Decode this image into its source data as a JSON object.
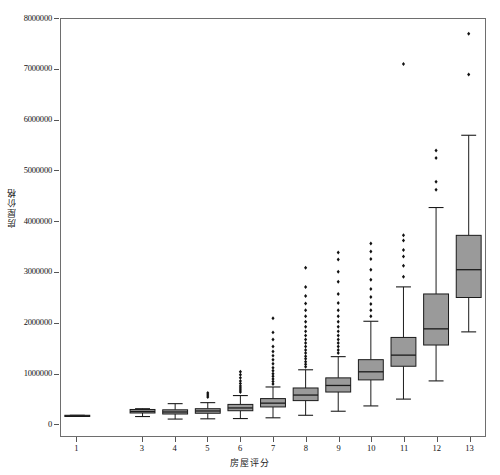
{
  "figure": {
    "background_color": "#ffffff",
    "frame_color": "#6e6e6e",
    "has_title": false,
    "title": ""
  },
  "axes": {
    "y_title": "房屋价格",
    "x_title": "房屋评分",
    "grid": false
  },
  "chart_data": {
    "type": "box",
    "title": "",
    "xlabel": "房屋评分",
    "ylabel": "房屋价格",
    "xlim": [
      0.5,
      13.5
    ],
    "ylim": [
      -250000,
      8000000
    ],
    "grid": false,
    "legend": null,
    "box_fill_color": "#9a9a9a",
    "box_edge_color": "#1a1a1a",
    "whisker_color": "#1a1a1a",
    "flier_color": "#111111",
    "y_ticks": [
      0,
      1000000,
      2000000,
      3000000,
      4000000,
      5000000,
      6000000,
      7000000,
      8000000
    ],
    "y_tick_labels": [
      "0",
      "1000000",
      "2000000",
      "3000000",
      "4000000",
      "5000000",
      "6000000",
      "7000000",
      "8000000"
    ],
    "x_ticks": [
      1,
      3,
      4,
      5,
      6,
      7,
      8,
      9,
      10,
      11,
      12,
      13
    ],
    "x_tick_labels": [
      "1",
      "3",
      "4",
      "5",
      "6",
      "7",
      "8",
      "9",
      "10",
      "11",
      "12",
      "13"
    ],
    "categories": [
      "1",
      "3",
      "4",
      "5",
      "6",
      "7",
      "8",
      "9",
      "10",
      "11",
      "12",
      "13"
    ],
    "boxes": [
      {
        "category": "1",
        "x": 1,
        "whisker_low": 142000,
        "q1": 142000,
        "median": 142000,
        "q3": 160000,
        "whisker_high": 160000,
        "fliers": []
      },
      {
        "category": "3",
        "x": 3,
        "whisker_low": 135000,
        "q1": 205000,
        "median": 235000,
        "q3": 275000,
        "whisker_high": 290000,
        "fliers": []
      },
      {
        "category": "4",
        "x": 4,
        "whisker_low": 85000,
        "q1": 185000,
        "median": 225000,
        "q3": 268000,
        "whisker_high": 390000,
        "fliers": []
      },
      {
        "category": "5",
        "x": 5,
        "whisker_low": 90000,
        "q1": 200000,
        "median": 245000,
        "q3": 290000,
        "whisker_high": 410000,
        "fliers": [
          520000,
          560000,
          600000
        ]
      },
      {
        "category": "6",
        "x": 6,
        "whisker_low": 95000,
        "q1": 250000,
        "median": 305000,
        "q3": 375000,
        "whisker_high": 550000,
        "fliers": [
          620000,
          660000,
          700000,
          740000,
          790000,
          840000,
          900000,
          960000,
          1020000
        ]
      },
      {
        "category": "7",
        "x": 7,
        "whisker_low": 110000,
        "q1": 325000,
        "median": 400000,
        "q3": 490000,
        "whisker_high": 720000,
        "fliers": [
          780000,
          830000,
          880000,
          930000,
          980000,
          1040000,
          1100000,
          1180000,
          1260000,
          1340000,
          1420000,
          1520000,
          1660000,
          1800000,
          2080000
        ]
      },
      {
        "category": "8",
        "x": 8,
        "whisker_low": 160000,
        "q1": 450000,
        "median": 560000,
        "q3": 700000,
        "whisker_high": 1060000,
        "fliers": [
          1120000,
          1170000,
          1220000,
          1280000,
          1330000,
          1390000,
          1450000,
          1520000,
          1590000,
          1660000,
          1740000,
          1820000,
          1910000,
          2010000,
          2120000,
          2240000,
          2370000,
          2520000,
          2700000,
          3080000
        ]
      },
      {
        "category": "9",
        "x": 9,
        "whisker_low": 240000,
        "q1": 620000,
        "median": 750000,
        "q3": 900000,
        "whisker_high": 1320000,
        "fliers": [
          1390000,
          1450000,
          1520000,
          1590000,
          1660000,
          1740000,
          1820000,
          1910000,
          2010000,
          2120000,
          2240000,
          2380000,
          2560000,
          2800000,
          3000000,
          3240000,
          3380000
        ]
      },
      {
        "category": "10",
        "x": 10,
        "whisker_low": 345000,
        "q1": 860000,
        "median": 1020000,
        "q3": 1260000,
        "whisker_high": 2020000,
        "fliers": [
          2120000,
          2240000,
          2360000,
          2500000,
          2660000,
          2840000,
          3040000,
          3250000,
          3400000,
          3560000
        ]
      },
      {
        "category": "11",
        "x": 11,
        "whisker_low": 480000,
        "q1": 1130000,
        "median": 1350000,
        "q3": 1700000,
        "whisker_high": 2700000,
        "fliers": [
          2900000,
          3120000,
          3300000,
          3430000,
          3620000,
          3720000,
          7110000
        ]
      },
      {
        "category": "12",
        "x": 12,
        "whisker_low": 840000,
        "q1": 1550000,
        "median": 1870000,
        "q3": 2560000,
        "whisker_high": 4270000,
        "fliers": [
          4620000,
          4780000,
          5250000,
          5400000
        ]
      },
      {
        "category": "13",
        "x": 13,
        "whisker_low": 1810000,
        "q1": 2490000,
        "median": 3040000,
        "q3": 3720000,
        "whisker_high": 5700000,
        "fliers": [
          6900000,
          7710000
        ]
      }
    ]
  }
}
